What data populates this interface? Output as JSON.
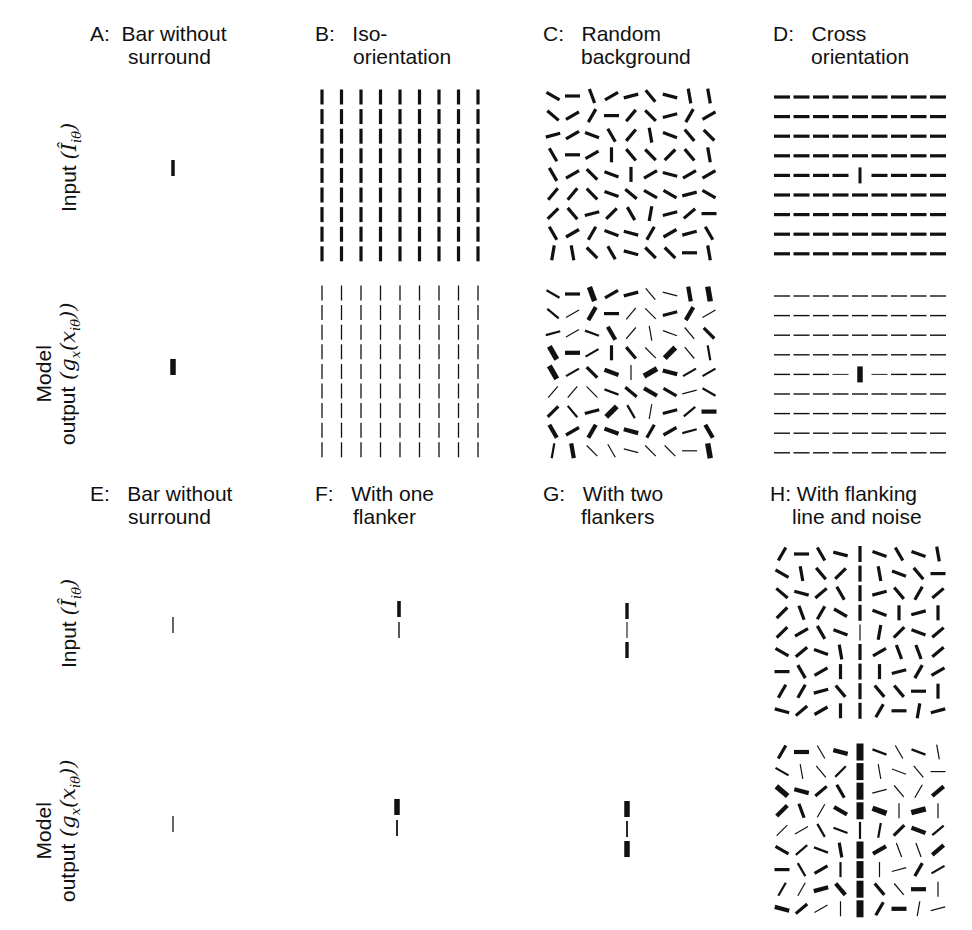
{
  "panels": [
    {
      "id": "A",
      "title_line1": "A:  Bar without",
      "title_line2": "surround",
      "x": 90,
      "y": 22
    },
    {
      "id": "B",
      "title_line1": "B:   Iso-",
      "title_line2": "orientation",
      "x": 315,
      "y": 22
    },
    {
      "id": "C",
      "title_line1": "C:   Random",
      "title_line2": "background",
      "x": 543,
      "y": 22
    },
    {
      "id": "D",
      "title_line1": "D:   Cross",
      "title_line2": "orientation",
      "x": 773,
      "y": 22
    },
    {
      "id": "E",
      "title_line1": "E:   Bar without",
      "title_line2": "surround",
      "x": 90,
      "y": 482
    },
    {
      "id": "F",
      "title_line1": "F:   With one",
      "title_line2": "flanker",
      "x": 315,
      "y": 482
    },
    {
      "id": "G",
      "title_line1": "G:   With two",
      "title_line2": "flankers",
      "x": 543,
      "y": 482
    },
    {
      "id": "H",
      "title_line1": "H: With flanking",
      "title_line2": "line and noise",
      "x": 770,
      "y": 482
    }
  ],
  "row_labels": {
    "input": "Input",
    "input_math": "(Î",
    "input_sub": "iθ",
    "output_line1": "Model",
    "output_line2": "output",
    "output_math": "(g",
    "output_math_sub": "x",
    "output_math_arg": "(x",
    "output_math_arg_sub": "iθ",
    "output_close": "))"
  },
  "grid": {
    "cols": 9,
    "rows": 9,
    "dx": 19.5,
    "dy": 19.6,
    "bar_len": 15
  },
  "stimuli": {
    "C_input_angles": [
      [
        150,
        0,
        110,
        30,
        15,
        130,
        165,
        100,
        100
      ],
      [
        140,
        30,
        60,
        0,
        50,
        135,
        15,
        60,
        30
      ],
      [
        15,
        30,
        160,
        120,
        50,
        100,
        160,
        130,
        135
      ],
      [
        120,
        0,
        30,
        90,
        130,
        135,
        45,
        130,
        100
      ],
      [
        120,
        30,
        135,
        160,
        90,
        30,
        165,
        30,
        30
      ],
      [
        50,
        50,
        135,
        160,
        140,
        150,
        150,
        15,
        150
      ],
      [
        45,
        130,
        15,
        45,
        120,
        80,
        15,
        40,
        0
      ],
      [
        120,
        30,
        60,
        160,
        165,
        60,
        30,
        15,
        120
      ],
      [
        80,
        100,
        135,
        120,
        165,
        135,
        135,
        0,
        100
      ]
    ],
    "C_output_widths": [
      [
        2,
        3,
        5,
        3,
        3,
        1,
        1,
        4,
        5
      ],
      [
        2,
        1,
        4,
        3,
        1,
        1,
        3,
        4,
        1
      ],
      [
        2,
        1,
        2,
        4,
        1,
        1,
        1,
        1,
        3
      ],
      [
        5,
        4,
        2,
        3,
        3,
        1,
        5,
        1,
        2
      ],
      [
        5,
        2,
        3,
        4,
        1,
        5,
        4,
        2,
        2
      ],
      [
        1,
        1,
        1,
        2,
        3,
        4,
        3,
        1,
        2
      ],
      [
        3,
        2,
        3,
        5,
        2,
        1,
        3,
        2,
        4
      ],
      [
        4,
        3,
        4,
        4,
        4,
        3,
        3,
        2,
        4
      ],
      [
        2,
        4,
        1,
        1,
        1,
        1,
        1,
        1,
        5
      ]
    ],
    "H_input_angles": [
      [
        60,
        0,
        120,
        165,
        90,
        160,
        120,
        160,
        100
      ],
      [
        150,
        100,
        130,
        45,
        90,
        100,
        160,
        130,
        0
      ],
      [
        140,
        165,
        40,
        120,
        90,
        15,
        130,
        60,
        40
      ],
      [
        45,
        110,
        60,
        150,
        90,
        160,
        90,
        15,
        90
      ],
      [
        45,
        30,
        120,
        160,
        90,
        80,
        45,
        160,
        40
      ],
      [
        150,
        40,
        160,
        100,
        90,
        30,
        110,
        110,
        40
      ],
      [
        0,
        120,
        30,
        90,
        90,
        90,
        15,
        60,
        30
      ],
      [
        60,
        60,
        15,
        130,
        90,
        130,
        130,
        0,
        90
      ],
      [
        165,
        40,
        30,
        90,
        90,
        60,
        0,
        80,
        15
      ]
    ],
    "H_output_widths": [
      [
        3,
        4,
        1,
        4,
        6,
        2,
        1,
        2,
        1
      ],
      [
        2,
        1,
        1,
        2,
        6,
        1,
        1,
        1,
        1
      ],
      [
        5,
        4,
        3,
        3,
        6,
        1,
        1,
        1,
        4
      ],
      [
        4,
        3,
        1,
        4,
        6,
        5,
        1,
        5,
        1
      ],
      [
        1,
        1,
        2,
        2,
        2,
        2,
        3,
        4,
        2
      ],
      [
        3,
        2,
        2,
        3,
        6,
        4,
        1,
        1,
        4
      ],
      [
        3,
        2,
        3,
        2,
        6,
        1,
        1,
        3,
        2
      ],
      [
        2,
        1,
        4,
        4,
        6,
        3,
        1,
        4,
        1
      ],
      [
        4,
        3,
        1,
        1,
        6,
        3,
        4,
        1,
        1
      ]
    ]
  },
  "colors": {
    "ink": "#111111",
    "background": "#ffffff"
  }
}
